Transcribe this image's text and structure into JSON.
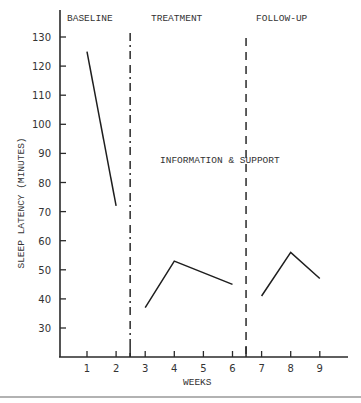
{
  "chart_data": {
    "type": "line",
    "title": "",
    "xlabel": "WEEKS",
    "ylabel": "SLEEP LATENCY (MINUTES)",
    "x_ticks": [
      1,
      2,
      3,
      4,
      5,
      6,
      7,
      8,
      9
    ],
    "y_ticks": [
      30,
      40,
      50,
      60,
      70,
      80,
      90,
      100,
      110,
      120,
      130
    ],
    "xlim": [
      0.1,
      10
    ],
    "ylim": [
      20,
      142
    ],
    "grid": false,
    "legend": null,
    "phases": [
      {
        "name": "BASELINE",
        "weeks": [
          1,
          2
        ]
      },
      {
        "name": "TREATMENT",
        "weeks": [
          3,
          4,
          5,
          6
        ]
      },
      {
        "name": "FOLLOW-UP",
        "weeks": [
          7,
          8,
          9
        ]
      }
    ],
    "phase_dividers": [
      {
        "x": 2.5,
        "style": "dash-dot"
      },
      {
        "x": 6.5,
        "style": "dashed"
      }
    ],
    "annotations": [
      {
        "text": "INFORMATION & SUPPORT",
        "x": 4.5,
        "y": 92
      }
    ],
    "series": [
      {
        "name": "Baseline",
        "x": [
          1,
          2
        ],
        "values": [
          125,
          72
        ]
      },
      {
        "name": "Treatment",
        "x": [
          3,
          4,
          6
        ],
        "values": [
          37,
          53,
          45
        ]
      },
      {
        "name": "Follow-up",
        "x": [
          7,
          8,
          9
        ],
        "values": [
          41,
          56,
          47
        ]
      }
    ]
  },
  "labels": {
    "baseline": "BASELINE",
    "treatment": "TREATMENT",
    "followup": "FOLLOW-UP",
    "annotation": "INFORMATION & SUPPORT",
    "xlabel": "WEEKS",
    "ylabel": "SLEEP LATENCY (MINUTES)"
  }
}
